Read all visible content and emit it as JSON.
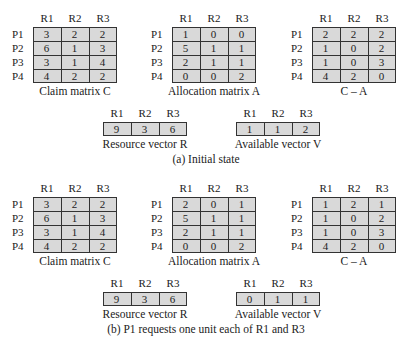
{
  "panels": [
    {
      "caption": "(a) Initial state",
      "columns": [
        "R1",
        "R2",
        "R3"
      ],
      "rows": [
        "P1",
        "P2",
        "P3",
        "P4"
      ],
      "claim": {
        "title": "Claim matrix C",
        "values": [
          [
            3,
            2,
            2
          ],
          [
            6,
            1,
            3
          ],
          [
            3,
            1,
            4
          ],
          [
            4,
            2,
            2
          ]
        ]
      },
      "allocation": {
        "title": "Allocation matrix A",
        "values": [
          [
            1,
            0,
            0
          ],
          [
            5,
            1,
            1
          ],
          [
            2,
            1,
            1
          ],
          [
            0,
            0,
            2
          ]
        ]
      },
      "need": {
        "title": "C – A",
        "values": [
          [
            2,
            2,
            2
          ],
          [
            1,
            0,
            2
          ],
          [
            1,
            0,
            3
          ],
          [
            4,
            2,
            0
          ]
        ]
      },
      "resource": {
        "title": "Resource vector R",
        "values": [
          9,
          3,
          6
        ]
      },
      "available": {
        "title": "Available vector V",
        "values": [
          1,
          1,
          2
        ]
      }
    },
    {
      "caption": "(b) P1 requests one unit each of R1 and R3",
      "columns": [
        "R1",
        "R2",
        "R3"
      ],
      "rows": [
        "P1",
        "P2",
        "P3",
        "P4"
      ],
      "claim": {
        "title": "Claim matrix C",
        "values": [
          [
            3,
            2,
            2
          ],
          [
            6,
            1,
            3
          ],
          [
            3,
            1,
            4
          ],
          [
            4,
            2,
            2
          ]
        ]
      },
      "allocation": {
        "title": "Allocation matrix A",
        "values": [
          [
            2,
            0,
            1
          ],
          [
            5,
            1,
            1
          ],
          [
            2,
            1,
            1
          ],
          [
            0,
            0,
            2
          ]
        ]
      },
      "need": {
        "title": "C – A",
        "values": [
          [
            1,
            2,
            1
          ],
          [
            1,
            0,
            2
          ],
          [
            1,
            0,
            3
          ],
          [
            4,
            2,
            0
          ]
        ]
      },
      "resource": {
        "title": "Resource vector R",
        "values": [
          9,
          3,
          6
        ]
      },
      "available": {
        "title": "Available vector V",
        "values": [
          0,
          1,
          1
        ]
      }
    }
  ]
}
